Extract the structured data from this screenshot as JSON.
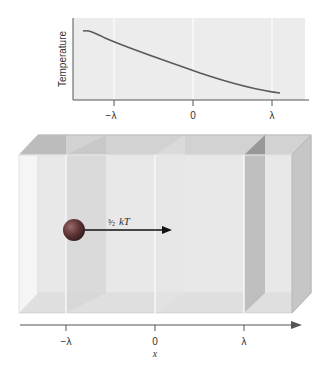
{
  "graph": {
    "ylabel": "Temperature",
    "ticks": [
      {
        "label": "−λ",
        "x": 114
      },
      {
        "label": "0",
        "x": 193
      },
      {
        "label": "λ",
        "x": 272
      }
    ],
    "curve_description": "Temperature decreases smoothly from left to right"
  },
  "box": {
    "arrow_label_fraction": "³⁄₂",
    "arrow_label_kT": "kT"
  },
  "axis": {
    "ticks": [
      {
        "label": "−λ"
      },
      {
        "label": "0"
      },
      {
        "label": "λ"
      }
    ],
    "xlabel": "x"
  },
  "colors": {
    "panel_bg": "#ececec",
    "curve": "#5a5a5a",
    "box_face": "#e4e4e4",
    "box_edge": "#bdbdbd",
    "sphere": "#6a3a3a"
  }
}
